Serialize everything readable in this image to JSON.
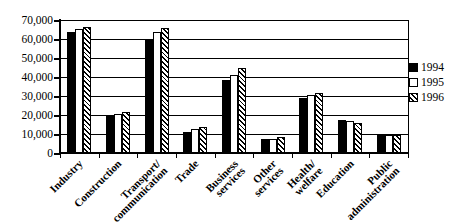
{
  "chart_data": {
    "type": "bar",
    "title": "",
    "xlabel": "",
    "ylabel": "",
    "categories": [
      "Industry",
      "Construction",
      "Transport/communication",
      "Trade",
      "Business services",
      "Other services",
      "Health/welfare",
      "Education",
      "Public administration"
    ],
    "category_label_lines": [
      [
        "Industry"
      ],
      [
        "Construction"
      ],
      [
        "Transport/",
        "communication"
      ],
      [
        "Trade"
      ],
      [
        "Business",
        "services"
      ],
      [
        "Other",
        "services"
      ],
      [
        "Health/",
        "welfare"
      ],
      [
        "Education"
      ],
      [
        "Public",
        "administration"
      ]
    ],
    "series": [
      {
        "name": "1994",
        "pattern": "solid-black",
        "values": [
          63500,
          19500,
          60000,
          11000,
          38500,
          7500,
          29000,
          17500,
          9500
        ]
      },
      {
        "name": "1995",
        "pattern": "white-outline",
        "values": [
          65000,
          20500,
          63500,
          12500,
          41000,
          7500,
          30500,
          17000,
          9500
        ]
      },
      {
        "name": "1996",
        "pattern": "diagonal-hatch",
        "values": [
          66500,
          21500,
          66000,
          13500,
          44500,
          8500,
          31500,
          16000,
          9500
        ]
      }
    ],
    "ylim": [
      0,
      70000
    ],
    "y_tick_interval": 10000,
    "y_tick_labels": [
      "0",
      "10,000",
      "20,000",
      "30,000",
      "40,000",
      "50,000",
      "60,000",
      "70,000"
    ],
    "grid": true,
    "legend_position": "right",
    "colors": {
      "foreground": "#000000",
      "background": "#ffffff"
    }
  }
}
